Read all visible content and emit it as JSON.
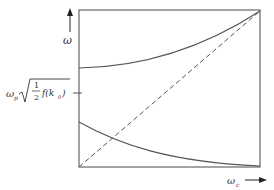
{
  "diagram": {
    "y_axis_label": "ω",
    "x_axis_label_main": "ω",
    "x_axis_label_sub": "c",
    "tick_label": {
      "prefix": "ω",
      "prefix_sub": "p",
      "frac_num": "1",
      "frac_den": "2",
      "func": "f(k",
      "func_sub": "0",
      "close": ")"
    },
    "curves": [
      {
        "name": "upper-branch",
        "description": "rises from left-mid to top-right corner"
      },
      {
        "name": "lower-branch",
        "description": "decays from left toward bottom-right"
      },
      {
        "name": "diagonal-line",
        "style": "dashed",
        "description": "ω = ω_c"
      }
    ],
    "colors": {
      "line": "#555555",
      "text": "#333333"
    }
  }
}
